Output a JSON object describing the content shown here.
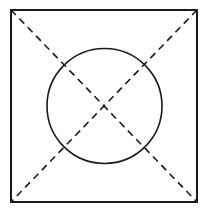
{
  "diagram": {
    "colors": {
      "stroke": "#1a1a1a",
      "background": "#ffffff"
    },
    "square": {
      "x": 11,
      "y": 10,
      "width": 186,
      "height": 192
    },
    "circle": {
      "cx": 104.5,
      "cy": 106,
      "r": 57.5
    },
    "diagonals": [
      {
        "x1": 11,
        "y1": 10,
        "x2": 197,
        "y2": 202,
        "style": "dashed"
      },
      {
        "x1": 197,
        "y1": 10,
        "x2": 11,
        "y2": 202,
        "style": "dashed"
      }
    ]
  }
}
